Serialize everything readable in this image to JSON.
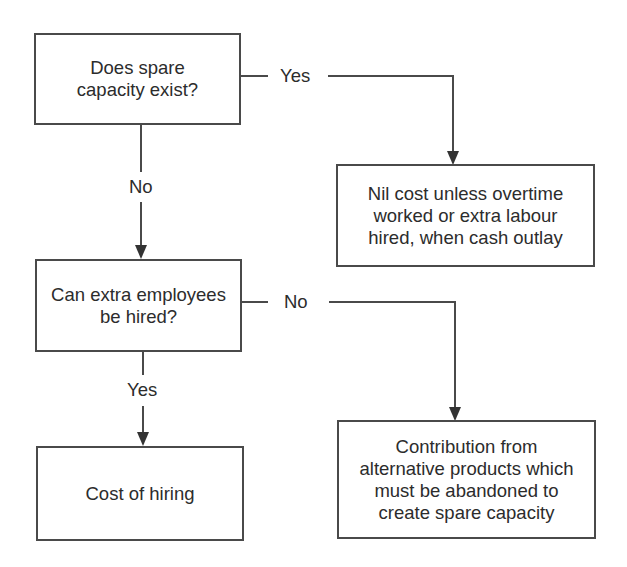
{
  "diagram": {
    "type": "flowchart",
    "nodes": {
      "q_spare_capacity": {
        "kind": "decision",
        "lines": [
          "Does spare",
          "capacity exist?"
        ]
      },
      "nil_cost": {
        "kind": "outcome",
        "lines": [
          "Nil cost unless overtime",
          "worked or extra labour",
          "hired, when cash outlay"
        ]
      },
      "q_extra_employees": {
        "kind": "decision",
        "lines": [
          "Can extra employees",
          "be hired?"
        ]
      },
      "cost_of_hiring": {
        "kind": "outcome",
        "lines": [
          "Cost of hiring"
        ]
      },
      "contribution": {
        "kind": "outcome",
        "lines": [
          "Contribution from",
          "alternative products which",
          "must be abandoned to",
          "create spare capacity"
        ]
      }
    },
    "edges": {
      "spare_yes": {
        "from": "q_spare_capacity",
        "to": "nil_cost",
        "label": "Yes"
      },
      "spare_no": {
        "from": "q_spare_capacity",
        "to": "q_extra_employees",
        "label": "No"
      },
      "hire_no": {
        "from": "q_extra_employees",
        "to": "contribution",
        "label": "No"
      },
      "hire_yes": {
        "from": "q_extra_employees",
        "to": "cost_of_hiring",
        "label": "Yes"
      }
    },
    "colors": {
      "stroke": "#4a4a4a",
      "text": "#2c2c2c",
      "background": "#ffffff"
    }
  }
}
